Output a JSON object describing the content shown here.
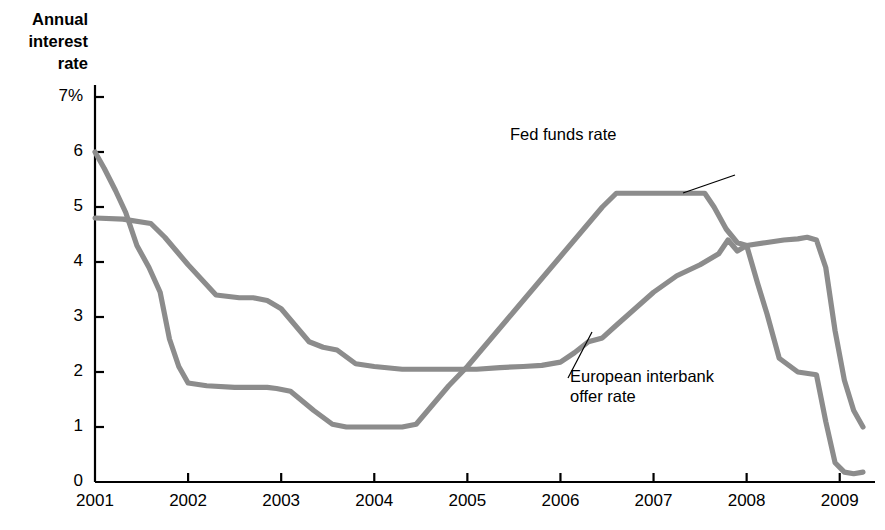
{
  "chart_data": {
    "type": "line",
    "title": "",
    "xlabel": "",
    "ylabel": "Annual\ninterest\nrate",
    "xlim": [
      2001,
      2009.25
    ],
    "ylim": [
      0,
      7
    ],
    "grid": false,
    "legend_position": "inline-annotations",
    "x_ticks": [
      "2001",
      "2002",
      "2003",
      "2004",
      "2005",
      "2006",
      "2007",
      "2008",
      "2009"
    ],
    "x_tick_values": [
      2001,
      2002,
      2003,
      2004,
      2005,
      2006,
      2007,
      2008,
      2009
    ],
    "y_ticks": [
      "0",
      "1",
      "2",
      "3",
      "4",
      "5",
      "6",
      "7%"
    ],
    "y_tick_values": [
      0,
      1,
      2,
      3,
      4,
      5,
      6,
      7
    ],
    "line_color": "#8c8c8c",
    "series": [
      {
        "name": "Fed funds rate",
        "annotation": "Fed funds rate",
        "x": [
          2001.0,
          2001.1,
          2001.22,
          2001.33,
          2001.45,
          2001.58,
          2001.7,
          2001.8,
          2001.9,
          2002.0,
          2002.2,
          2002.5,
          2002.85,
          2002.95,
          2003.1,
          2003.35,
          2003.55,
          2003.7,
          2003.9,
          2004.1,
          2004.3,
          2004.45,
          2004.6,
          2004.8,
          2005.0,
          2005.25,
          2005.5,
          2005.75,
          2006.0,
          2006.25,
          2006.45,
          2006.6,
          2006.75,
          2007.0,
          2007.3,
          2007.55,
          2007.65,
          2007.78,
          2007.9,
          2008.0,
          2008.12,
          2008.22,
          2008.35,
          2008.55,
          2008.75,
          2008.85,
          2008.95,
          2009.05,
          2009.15,
          2009.25
        ],
        "y": [
          6.0,
          5.7,
          5.3,
          4.9,
          4.3,
          3.9,
          3.45,
          2.6,
          2.1,
          1.8,
          1.75,
          1.72,
          1.72,
          1.7,
          1.65,
          1.3,
          1.05,
          1.0,
          1.0,
          1.0,
          1.0,
          1.05,
          1.35,
          1.75,
          2.1,
          2.6,
          3.1,
          3.6,
          4.1,
          4.6,
          5.0,
          5.25,
          5.25,
          5.25,
          5.25,
          5.25,
          5.0,
          4.6,
          4.35,
          4.3,
          3.6,
          3.05,
          2.25,
          2.0,
          1.95,
          1.1,
          0.35,
          0.18,
          0.15,
          0.18
        ]
      },
      {
        "name": "European interbank offer rate",
        "annotation": "European interbank\noffer rate",
        "x": [
          2001.0,
          2001.3,
          2001.6,
          2001.75,
          2001.9,
          2002.0,
          2002.3,
          2002.55,
          2002.7,
          2002.85,
          2003.0,
          2003.15,
          2003.3,
          2003.45,
          2003.6,
          2003.8,
          2004.0,
          2004.3,
          2004.6,
          2004.9,
          2005.1,
          2005.35,
          2005.6,
          2005.8,
          2006.0,
          2006.15,
          2006.3,
          2006.45,
          2006.6,
          2006.8,
          2007.0,
          2007.25,
          2007.5,
          2007.7,
          2007.8,
          2007.9,
          2008.0,
          2008.2,
          2008.4,
          2008.55,
          2008.65,
          2008.75,
          2008.85,
          2008.95,
          2009.05,
          2009.15,
          2009.25
        ],
        "y": [
          4.8,
          4.78,
          4.7,
          4.45,
          4.15,
          3.95,
          3.4,
          3.35,
          3.35,
          3.3,
          3.15,
          2.85,
          2.55,
          2.45,
          2.4,
          2.15,
          2.1,
          2.05,
          2.05,
          2.05,
          2.05,
          2.08,
          2.1,
          2.12,
          2.18,
          2.35,
          2.55,
          2.62,
          2.85,
          3.15,
          3.45,
          3.75,
          3.95,
          4.15,
          4.4,
          4.2,
          4.3,
          4.35,
          4.4,
          4.42,
          4.45,
          4.4,
          3.9,
          2.75,
          1.85,
          1.3,
          1.0
        ]
      }
    ]
  },
  "axis": {
    "y_title": "Annual\ninterest\nrate"
  },
  "annotations": {
    "fed": {
      "text": "Fed funds rate",
      "leader_from": [
        735,
        175
      ],
      "leader_to": [
        683,
        193
      ]
    },
    "euribor": {
      "text": "European interbank\noffer rate",
      "leader_from": [
        568,
        378
      ],
      "leader_to": [
        592,
        332
      ]
    }
  }
}
